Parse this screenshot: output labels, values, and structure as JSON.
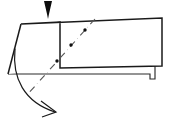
{
  "figure": {
    "kind": "origami-fold-diagram",
    "canvas": {
      "width": 171,
      "height": 128,
      "background": "#ffffff"
    },
    "colors": {
      "paper_fill": "#ffffff",
      "outline": "#1a1a1a",
      "secondary_outline": "#2b2b2b",
      "fold_line": "#555555",
      "arrow_fill": "#0d0d0d"
    },
    "shapes": {
      "lower_flap": {
        "name": "lower-paper-flap",
        "points": "8,74 21,24 155,63 155,79 150,79 150,74"
      },
      "left_side_face": {
        "name": "left-side-face",
        "points": "21,24 60,22 60,68 8,74"
      },
      "top_panel": {
        "name": "top-paper-panel",
        "points": "21,24 162,18 162,66 60,68"
      },
      "lower_step_edge": {
        "name": "lower-step-edge",
        "path": "M 8,74 L 150,74 L 150,79 L 155,79 L 155,63"
      },
      "top_panel_edges": {
        "name": "top-panel-edges",
        "path": "M 21,24 L 162,18 L 162,66 L 60,68 L 60,22 Z"
      },
      "left_slant_edge": {
        "name": "left-slant-edge",
        "path": "M 21,24 L 8,74"
      }
    },
    "fold_line": {
      "name": "valley-fold-line",
      "style": "dash-dot",
      "start": {
        "x": 95,
        "y": 19
      },
      "end": {
        "x": 27,
        "y": 95
      },
      "dash_pattern": "7 4 0.1 4",
      "stroke_width": 1.1,
      "dots": [
        {
          "x": 85,
          "y": 30
        },
        {
          "x": 71,
          "y": 45
        },
        {
          "x": 57,
          "y": 61
        }
      ]
    },
    "push_arrow": {
      "name": "push-down-arrow",
      "direction": "down",
      "tip": {
        "x": 48,
        "y": 19
      },
      "top_left": {
        "x": 44,
        "y": 1
      },
      "top_right": {
        "x": 52,
        "y": 1
      },
      "points": "44,1 52,1 49,14 48,19 47,14"
    },
    "fold_motion_arrow": {
      "name": "fold-motion-arrow",
      "direction": "clockwise-down-right",
      "arc_path": "M 15,49 C 12,78 24,102 55,112",
      "head_path": "M 41,101 L 56,112 L 42,117",
      "stroke_width": 1.2
    }
  }
}
